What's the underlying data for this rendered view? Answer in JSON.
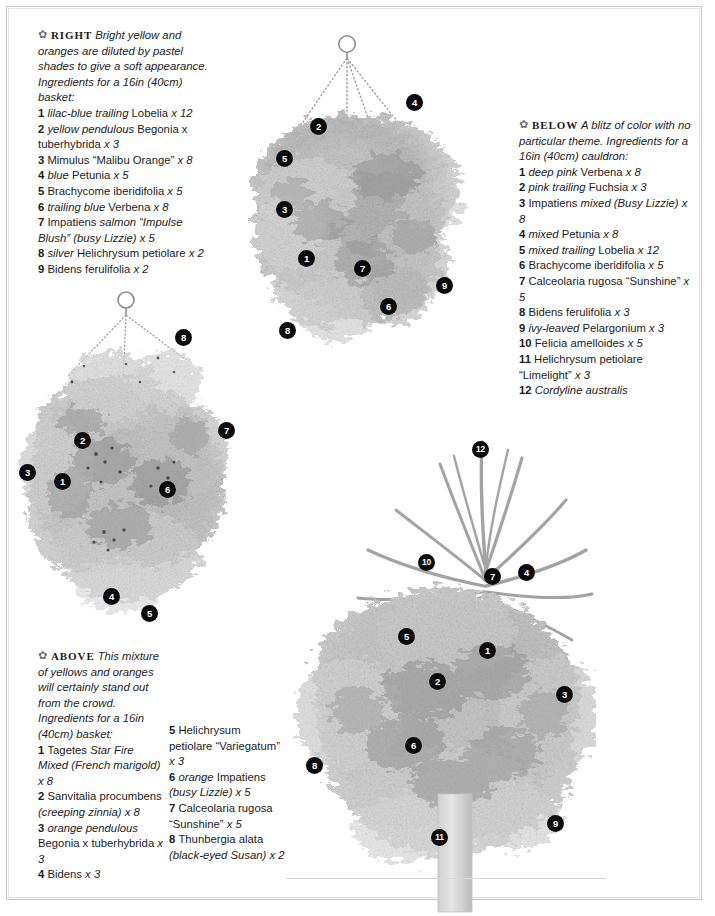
{
  "page": {
    "background": "#ffffff",
    "border_color": "#c9c9c9",
    "callout_color": "#0a0a0a",
    "callout_text_color": "#ffffff"
  },
  "captions": {
    "right": {
      "ornament": "leaf-ornament",
      "kicker": "RIGHT",
      "intro": "Bright yellow and oranges are diluted by pastel shades to give a soft appearance. Ingredients for a 16in (40cm) basket:",
      "items": [
        {
          "n": "1",
          "italic_lead": "lilac-blue trailing",
          "rest": "Lobelia",
          "qty": "x 12"
        },
        {
          "n": "2",
          "italic_lead": "yellow pendulous",
          "rest": "Begonia x tuberhybrida",
          "qty": "x 3"
        },
        {
          "n": "3",
          "italic_lead": "",
          "rest": "Mimulus",
          "quoted": "“Malibu Orange”",
          "qty": "x 8"
        },
        {
          "n": "4",
          "italic_lead": "blue",
          "rest": "Petunia",
          "qty": "x 5"
        },
        {
          "n": "5",
          "italic_lead": "",
          "rest": "Brachycome iberidifolia",
          "qty": "x 5"
        },
        {
          "n": "6",
          "italic_lead": "trailing blue",
          "rest": "Verbena",
          "qty": "x 8"
        },
        {
          "n": "7",
          "italic_lead": "",
          "rest": "Impatiens",
          "italic_mid": "salmon “Impulse Blush” (busy Lizzie)",
          "qty": "x 5"
        },
        {
          "n": "8",
          "italic_lead": "silver",
          "rest": "Helichrysum petiolare",
          "qty": "x 2"
        },
        {
          "n": "9",
          "italic_lead": "",
          "rest": "Bidens ferulifolia",
          "qty": "x 2"
        }
      ]
    },
    "below": {
      "ornament": "leaf-ornament",
      "kicker": "BELOW",
      "intro": "A blitz of color with no particular theme. Ingredients for a 16in (40cm) cauldron:",
      "items": [
        {
          "n": "1",
          "italic_lead": "deep pink",
          "rest": "Verbena",
          "qty": "x 8"
        },
        {
          "n": "2",
          "italic_lead": "pink trailing",
          "rest": "Fuchsia",
          "qty": "x 3"
        },
        {
          "n": "3",
          "italic_lead": "",
          "rest": "Impatiens",
          "italic_mid": "mixed (Busy Lizzie)",
          "qty": "x 8"
        },
        {
          "n": "4",
          "italic_lead": "mixed",
          "rest": "Petunia",
          "qty": "x 8"
        },
        {
          "n": "5",
          "italic_lead": "mixed trailing",
          "rest": "Lobelia",
          "qty": "x 12"
        },
        {
          "n": "6",
          "italic_lead": "",
          "rest": "Brachycome iberidifolia",
          "qty": "x 5"
        },
        {
          "n": "7",
          "italic_lead": "",
          "rest": "Calceolaria rugosa",
          "quoted": "“Sunshine”",
          "qty": "x 5"
        },
        {
          "n": "8",
          "italic_lead": "",
          "rest": "Bidens ferulifolia",
          "qty": "x 3"
        },
        {
          "n": "9",
          "italic_lead": "ivy-leaved",
          "rest": "Pelargonium",
          "qty": "x 3"
        },
        {
          "n": "10",
          "italic_lead": "",
          "rest": "Felicia amelloides",
          "qty": "x 5"
        },
        {
          "n": "11",
          "italic_lead": "",
          "rest": "Helichrysum petiolare",
          "quoted": "“Limelight”",
          "qty": "x 3"
        },
        {
          "n": "12",
          "italic_lead": "Cordyline australis",
          "rest": "",
          "qty": ""
        }
      ]
    },
    "above": {
      "ornament": "leaf-ornament",
      "kicker": "ABOVE",
      "intro": "This mixture of yellows and oranges will certainly stand out from the crowd. Ingredients for a 16in (40cm) basket:",
      "items_col1": [
        {
          "n": "1",
          "italic_lead": "",
          "rest": "Tagetes",
          "italic_mid": "Star Fire Mixed (French marigold)",
          "qty": "x 8"
        },
        {
          "n": "2",
          "italic_lead": "",
          "rest": "Sanvitalia procumbens",
          "italic_mid": "(creeping zinnia)",
          "qty": "x 8"
        },
        {
          "n": "3",
          "italic_lead": "orange pendulous",
          "rest": "Begonia x tuberhybrida",
          "qty": "x 3"
        },
        {
          "n": "4",
          "italic_lead": "",
          "rest": "Bidens",
          "qty": "x 3"
        }
      ],
      "items_col2": [
        {
          "n": "5",
          "italic_lead": "",
          "rest": "Helichrysum petiolare",
          "quoted": "“Variegatum”",
          "qty": "x 3"
        },
        {
          "n": "6",
          "italic_lead": "orange",
          "rest": "Impatiens",
          "italic_mid": "(busy Lizzie)",
          "qty": "x 5"
        },
        {
          "n": "7",
          "italic_lead": "",
          "rest": "Calceolaria rugosa",
          "quoted": "“Sunshine”",
          "qty": "x 5"
        },
        {
          "n": "8",
          "italic_lead": "",
          "rest": "Thunbergia alata",
          "italic_mid": "(black-eyed Susan)",
          "qty": "x 2"
        }
      ]
    }
  },
  "illustrations": [
    {
      "name": "hanging-basket-top",
      "title": "Hanging basket with chain and hook",
      "callouts": [
        {
          "label": "4",
          "x": 414,
          "y": 102
        },
        {
          "label": "2",
          "x": 318,
          "y": 126
        },
        {
          "label": "5",
          "x": 284,
          "y": 158
        },
        {
          "label": "3",
          "x": 284,
          "y": 209
        },
        {
          "label": "1",
          "x": 306,
          "y": 258
        },
        {
          "label": "7",
          "x": 362,
          "y": 268
        },
        {
          "label": "9",
          "x": 444,
          "y": 285
        },
        {
          "label": "6",
          "x": 388,
          "y": 306
        },
        {
          "label": "8",
          "x": 287,
          "y": 330
        }
      ]
    },
    {
      "name": "hanging-basket-left",
      "title": "Hanging basket of mixed yellows and oranges",
      "callouts": [
        {
          "label": "8",
          "x": 183,
          "y": 337
        },
        {
          "label": "7",
          "x": 226,
          "y": 430
        },
        {
          "label": "2",
          "x": 82,
          "y": 440
        },
        {
          "label": "3",
          "x": 27,
          "y": 472
        },
        {
          "label": "1",
          "x": 62,
          "y": 481
        },
        {
          "label": "6",
          "x": 167,
          "y": 489
        },
        {
          "label": "4",
          "x": 111,
          "y": 596
        },
        {
          "label": "5",
          "x": 149,
          "y": 613
        }
      ]
    },
    {
      "name": "cauldron-standard",
      "title": "Cordyline standard in a cauldron of mixed summer color",
      "callouts": [
        {
          "label": "12",
          "x": 480,
          "y": 449
        },
        {
          "label": "10",
          "x": 426,
          "y": 562
        },
        {
          "label": "7",
          "x": 492,
          "y": 576
        },
        {
          "label": "4",
          "x": 526,
          "y": 572
        },
        {
          "label": "5",
          "x": 406,
          "y": 636
        },
        {
          "label": "1",
          "x": 487,
          "y": 650
        },
        {
          "label": "2",
          "x": 437,
          "y": 681
        },
        {
          "label": "3",
          "x": 564,
          "y": 694
        },
        {
          "label": "6",
          "x": 413,
          "y": 745
        },
        {
          "label": "8",
          "x": 314,
          "y": 765
        },
        {
          "label": "9",
          "x": 555,
          "y": 823
        },
        {
          "label": "11",
          "x": 439,
          "y": 837
        }
      ]
    }
  ]
}
